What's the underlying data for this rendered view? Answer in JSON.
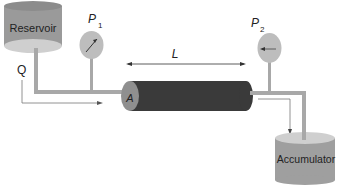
{
  "diagram": {
    "reservoir": {
      "label": "Reservoir"
    },
    "accumulator": {
      "label": "Accumulator"
    },
    "gauge_inlet": {
      "label": "P",
      "subscript": "1"
    },
    "gauge_outlet": {
      "label": "P",
      "subscript": "2"
    },
    "length": {
      "label": "L"
    },
    "area": {
      "label": "A"
    },
    "flow": {
      "label": "Q"
    },
    "colors": {
      "tank": "#9a9a9a",
      "tank_top": "#c8c8c8",
      "pipe": "#a8a8a8",
      "tube": "#3a3a3a",
      "tube_cap": "#8f8f8f",
      "gauge": "#bdbdbd",
      "arrow": "#555555"
    }
  }
}
